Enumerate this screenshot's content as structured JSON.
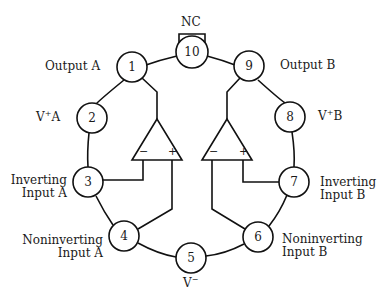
{
  "pins": [
    {
      "num": "1",
      "label": "Output A"
    },
    {
      "num": "2",
      "label": "V+A"
    },
    {
      "num": "3",
      "label": "Inverting Input A"
    },
    {
      "num": "4",
      "label": "Noninverting Input A"
    },
    {
      "num": "5",
      "label": "V−"
    },
    {
      "num": "6",
      "label": "Noninverting Input B"
    },
    {
      "num": "7",
      "label": "Inverting Input B"
    },
    {
      "num": "8",
      "label": "V+B"
    },
    {
      "num": "9",
      "label": "Output B"
    },
    {
      "num": "10",
      "label": "NC"
    }
  ],
  "labels": {
    "nc": "NC",
    "output_a": "Output A",
    "output_b": "Output B",
    "v_plus_a_v": "V",
    "v_plus_a_sup": "+",
    "v_plus_a_suffix": "A",
    "v_plus_b_v": "V",
    "v_plus_b_sup": "+",
    "v_plus_b_suffix": "B",
    "inv_a_line1": "Inverting",
    "inv_a_line2": "Input A",
    "noninv_a_line1": "Noninverting",
    "noninv_a_line2": "Input A",
    "inv_b_line1": "Inverting",
    "inv_b_line2": "Input B",
    "noninv_b_line1": "Noninverting",
    "noninv_b_line2": "Input B",
    "v_minus_v": "V",
    "v_minus_sup": "−"
  },
  "opamps": [
    {
      "name": "A",
      "minus": "−",
      "plus": "+"
    },
    {
      "name": "B",
      "minus": "−",
      "plus": "+"
    }
  ]
}
